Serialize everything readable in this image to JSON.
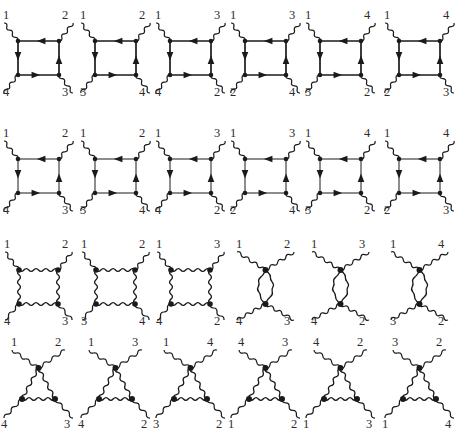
{
  "figure": {
    "width": 461,
    "height": 446,
    "background": "#ffffff",
    "ink": "#1a1a1a",
    "label_color": "#2b2b2b",
    "rows": [
      {
        "name": "row-1-fermion-box-diagrams",
        "style": "fermion-box",
        "diagrams": [
          {
            "top_left": "1",
            "top_right": "2",
            "bottom_left": "4",
            "bottom_right": "3"
          },
          {
            "top_left": "1",
            "top_right": "2",
            "bottom_left": "3",
            "bottom_right": "4"
          },
          {
            "top_left": "1",
            "top_right": "3",
            "bottom_left": "4",
            "bottom_right": "2"
          },
          {
            "top_left": "1",
            "top_right": "3",
            "bottom_left": "2",
            "bottom_right": "4"
          },
          {
            "top_left": "1",
            "top_right": "4",
            "bottom_left": "3",
            "bottom_right": "2"
          },
          {
            "top_left": "1",
            "top_right": "4",
            "bottom_left": "2",
            "bottom_right": "3"
          }
        ]
      },
      {
        "name": "row-2-fermion-box-thin-diagrams",
        "style": "fermion-box-thin",
        "diagrams": [
          {
            "top_left": "1",
            "top_right": "2",
            "bottom_left": "4",
            "bottom_right": "3"
          },
          {
            "top_left": "1",
            "top_right": "2",
            "bottom_left": "3",
            "bottom_right": "4"
          },
          {
            "top_left": "1",
            "top_right": "3",
            "bottom_left": "4",
            "bottom_right": "2"
          },
          {
            "top_left": "1",
            "top_right": "3",
            "bottom_left": "2",
            "bottom_right": "4"
          },
          {
            "top_left": "1",
            "top_right": "4",
            "bottom_left": "3",
            "bottom_right": "2"
          },
          {
            "top_left": "1",
            "top_right": "4",
            "bottom_left": "2",
            "bottom_right": "3"
          }
        ]
      },
      {
        "name": "row-3-photon-box-and-bubble-diagrams",
        "style": "photon-mixed",
        "diagrams": [
          {
            "kind": "photon-box",
            "top_left": "1",
            "top_right": "2",
            "bottom_left": "4",
            "bottom_right": "3"
          },
          {
            "kind": "photon-box",
            "top_left": "1",
            "top_right": "2",
            "bottom_left": "3",
            "bottom_right": "4"
          },
          {
            "kind": "photon-box",
            "top_left": "1",
            "top_right": "3",
            "bottom_left": "4",
            "bottom_right": "2"
          },
          {
            "kind": "photon-bubble",
            "top_left": "1",
            "top_right": "2",
            "bottom_left": "4",
            "bottom_right": "3"
          },
          {
            "kind": "photon-bubble",
            "top_left": "1",
            "top_right": "3",
            "bottom_left": "4",
            "bottom_right": "2"
          },
          {
            "kind": "photon-bubble",
            "top_left": "1",
            "top_right": "4",
            "bottom_left": "3",
            "bottom_right": "2"
          }
        ]
      },
      {
        "name": "row-4-photon-triangle-diagrams",
        "style": "photon-triangle",
        "diagrams": [
          {
            "top_left": "1",
            "top_right": "2",
            "bottom_left": "4",
            "bottom_right": "3"
          },
          {
            "top_left": "1",
            "top_right": "3",
            "bottom_left": "4",
            "bottom_right": "2"
          },
          {
            "top_left": "1",
            "top_right": "4",
            "bottom_left": "3",
            "bottom_right": "2"
          },
          {
            "top_left": "4",
            "top_right": "3",
            "bottom_left": "1",
            "bottom_right": "2"
          },
          {
            "top_left": "4",
            "top_right": "2",
            "bottom_left": "1",
            "bottom_right": "3"
          },
          {
            "top_left": "3",
            "top_right": "2",
            "bottom_left": "1",
            "bottom_right": "4"
          }
        ]
      }
    ]
  }
}
